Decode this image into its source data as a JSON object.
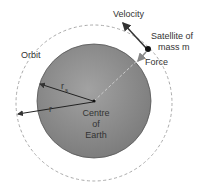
{
  "diagram": {
    "labels": {
      "velocity": "Velocity",
      "satellite_line1": "Satellite of",
      "satellite_line2": "mass m",
      "force": "Force",
      "orbit": "Orbit",
      "rs": "r",
      "rs_sub": "s",
      "r": "r",
      "centre_line1": "Centre",
      "centre_line2": "of",
      "centre_line3": "Earth"
    },
    "colors": {
      "earth_fill": "#8f8f8f",
      "earth_edge": "#555555",
      "orbit_stroke": "#aaaaaa",
      "arrow": "#333333",
      "force_arrow": "#888888"
    }
  }
}
